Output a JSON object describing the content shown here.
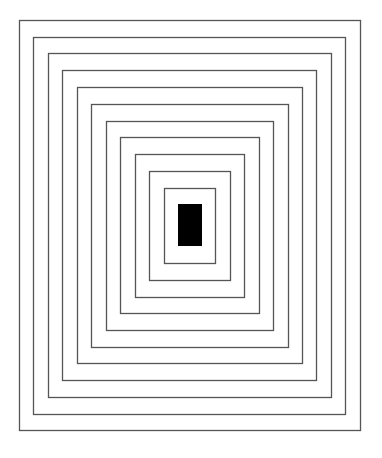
{
  "canvas": {
    "width": 382,
    "height": 458,
    "background": "#ffffff"
  },
  "stroke": {
    "color": "#555555",
    "width": 1.3
  },
  "rectangles": [
    {
      "x": 19,
      "y": 20,
      "w": 341,
      "h": 410
    },
    {
      "x": 33,
      "y": 37,
      "w": 312,
      "h": 377
    },
    {
      "x": 48,
      "y": 53,
      "w": 283,
      "h": 344
    },
    {
      "x": 62,
      "y": 70,
      "w": 254,
      "h": 310
    },
    {
      "x": 77,
      "y": 87,
      "w": 225,
      "h": 276
    },
    {
      "x": 91,
      "y": 104,
      "w": 197,
      "h": 243
    },
    {
      "x": 106,
      "y": 121,
      "w": 167,
      "h": 209
    },
    {
      "x": 120,
      "y": 137,
      "w": 139,
      "h": 176
    },
    {
      "x": 135,
      "y": 154,
      "w": 109,
      "h": 143
    },
    {
      "x": 149,
      "y": 171,
      "w": 81,
      "h": 109
    },
    {
      "x": 164,
      "y": 188,
      "w": 51,
      "h": 75
    }
  ],
  "center_block": {
    "x": 178,
    "y": 204,
    "w": 24,
    "h": 42,
    "fill": "#000000"
  }
}
